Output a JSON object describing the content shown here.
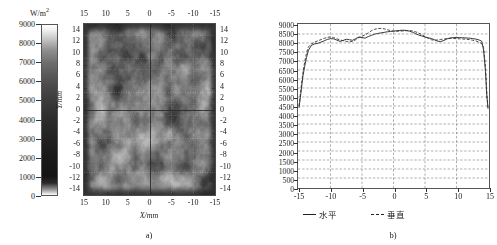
{
  "figure": {
    "panels": [
      {
        "id": "a",
        "caption": "a)"
      },
      {
        "id": "b",
        "caption": "b)"
      }
    ]
  },
  "panel_a": {
    "caption": "a)",
    "colorbar": {
      "unit": "W/m<sup>2</sup>",
      "unit_text": "W/m2",
      "ticks": [
        9000,
        8000,
        7000,
        6000,
        5000,
        4000,
        3000,
        2000,
        1000,
        0
      ],
      "min": 0,
      "max": 9000,
      "colormap": "grayscale"
    },
    "xlabel": "X/mm",
    "ylabel": "Y/mm",
    "x_ticks_top": [
      15,
      10,
      5,
      0,
      -5,
      -10,
      -15
    ],
    "x_ticks_bottom": [
      15,
      10,
      5,
      0,
      -5,
      -10,
      -15
    ],
    "y_ticks_left": [
      14,
      12,
      10,
      8,
      6,
      4,
      2,
      0,
      -2,
      -4,
      -6,
      -8,
      -10,
      -12,
      -14
    ],
    "y_ticks_right": [
      14,
      12,
      10,
      8,
      6,
      4,
      2,
      0,
      -2,
      -4,
      -6,
      -8,
      -10,
      -12,
      -14
    ],
    "xlim": [
      15,
      -15
    ],
    "ylim": [
      -15,
      15
    ]
  },
  "chart_data": {
    "type": "line",
    "title": "",
    "panel": "b)",
    "xlabel": "",
    "ylabel": "",
    "xlim": [
      -15,
      15
    ],
    "ylim": [
      0,
      9000
    ],
    "grid": true,
    "legend_position": "below-axes",
    "x_ticks": [
      -15,
      -10,
      -5,
      0,
      5,
      10,
      15
    ],
    "y_ticks": [
      0,
      500,
      1000,
      1500,
      2000,
      2500,
      3000,
      3500,
      4000,
      4500,
      5000,
      5500,
      6000,
      6500,
      7000,
      7500,
      8000,
      8500,
      9000
    ],
    "x": [
      -15.0,
      -14.7,
      -14.4,
      -14.1,
      -13.8,
      -13.5,
      -13.0,
      -12.5,
      -12.0,
      -11.5,
      -11.0,
      -10.5,
      -10.0,
      -9.5,
      -9.0,
      -8.5,
      -8.0,
      -7.5,
      -7.0,
      -6.5,
      -6.0,
      -5.5,
      -5.0,
      -4.5,
      -4.0,
      -3.5,
      -3.0,
      -2.5,
      -2.0,
      -1.5,
      -1.0,
      -0.5,
      0.0,
      0.5,
      1.0,
      1.5,
      2.0,
      2.5,
      3.0,
      3.5,
      4.0,
      4.5,
      5.0,
      5.5,
      6.0,
      6.5,
      7.0,
      7.5,
      8.0,
      8.5,
      9.0,
      9.5,
      10.0,
      10.5,
      11.0,
      11.5,
      12.0,
      12.5,
      13.0,
      13.5,
      14.0,
      14.3,
      14.6,
      14.8,
      15.0
    ],
    "series": [
      {
        "name": "水平",
        "name_en": "horizontal",
        "style": "solid",
        "color": "#222222",
        "values": [
          4400,
          5200,
          6100,
          6700,
          7200,
          7600,
          7880,
          7950,
          7980,
          8050,
          8120,
          8200,
          8240,
          8230,
          8160,
          8090,
          8140,
          8210,
          8180,
          8150,
          8240,
          8330,
          8300,
          8270,
          8360,
          8420,
          8490,
          8530,
          8560,
          8590,
          8620,
          8640,
          8660,
          8680,
          8700,
          8710,
          8700,
          8660,
          8600,
          8520,
          8440,
          8390,
          8330,
          8290,
          8250,
          8180,
          8100,
          8080,
          8140,
          8230,
          8280,
          8300,
          8310,
          8300,
          8290,
          8280,
          8270,
          8250,
          8220,
          8180,
          8100,
          7600,
          6400,
          5100,
          4350
        ]
      },
      {
        "name": "垂直",
        "name_en": "vertical",
        "style": "dashed",
        "color": "#333333",
        "values": [
          4500,
          5400,
          6300,
          6950,
          7450,
          7780,
          7960,
          8050,
          8120,
          8190,
          8260,
          8310,
          8340,
          8300,
          8230,
          8170,
          8130,
          8090,
          8060,
          8090,
          8180,
          8300,
          8380,
          8450,
          8560,
          8680,
          8760,
          8800,
          8810,
          8790,
          8740,
          8690,
          8660,
          8650,
          8660,
          8670,
          8680,
          8690,
          8670,
          8620,
          8550,
          8460,
          8360,
          8260,
          8180,
          8150,
          8170,
          8200,
          8220,
          8240,
          8250,
          8250,
          8240,
          8230,
          8220,
          8210,
          8190,
          8160,
          8120,
          8060,
          7960,
          7750,
          6700,
          5300,
          4400
        ]
      }
    ]
  },
  "legend": {
    "items": [
      {
        "label": "水平",
        "style": "solid"
      },
      {
        "label": "垂直",
        "style": "dashed"
      }
    ]
  }
}
